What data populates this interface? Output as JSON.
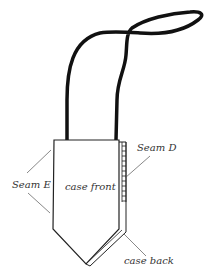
{
  "diagram": {
    "type": "sewing-pattern-illustration",
    "labels": {
      "seam_d": "Seam D",
      "seam_e": "Seam E",
      "case_front": "case front",
      "case_back": "case back"
    },
    "colors": {
      "line": "#111111",
      "label": "#333333",
      "background": "#ffffff"
    }
  }
}
